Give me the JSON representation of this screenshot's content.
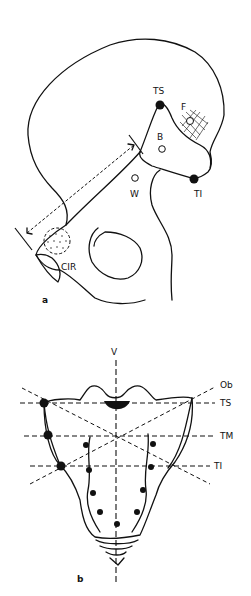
{
  "figure": {
    "panel_a": {
      "label": "a",
      "points": {
        "ts": "TS",
        "ti": "TI",
        "f": "F",
        "b": "B",
        "w": "W",
        "cir": "CIR"
      }
    },
    "panel_b": {
      "label": "b",
      "lines": {
        "v": "V",
        "ob": "Ob",
        "ts": "TS",
        "tm": "TM",
        "ti": "TI"
      }
    }
  }
}
